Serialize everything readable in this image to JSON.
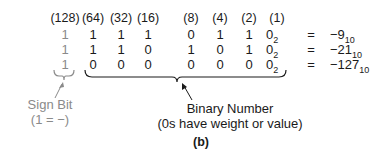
{
  "figure": {
    "weights": [
      "(128)",
      "(64)",
      "(32)",
      "(16)",
      "(8)",
      "(4)",
      "(2)",
      "(1)"
    ],
    "rows": [
      {
        "sign": "1",
        "bits": [
          "1",
          "1",
          "1",
          "0",
          "1",
          "1"
        ],
        "last": "0",
        "base": "2",
        "eq": "=",
        "value": "−9",
        "value_base": "10"
      },
      {
        "sign": "1",
        "bits": [
          "1",
          "1",
          "0",
          "1",
          "0",
          "1"
        ],
        "last": "0",
        "base": "2",
        "eq": "=",
        "value": "−21",
        "value_base": "10"
      },
      {
        "sign": "1",
        "bits": [
          "0",
          "0",
          "0",
          "0",
          "0",
          "0"
        ],
        "last": "0",
        "base": "2",
        "eq": "=",
        "value": "−127",
        "value_base": "10"
      }
    ],
    "sign_label": {
      "line1": "Sign Bit",
      "line2": "(1 = −)"
    },
    "binary_label": {
      "line1": "Binary Number",
      "line2": "(0s have weight or value)"
    },
    "caption": "(b)",
    "colors": {
      "text": "#1a1a1a",
      "sign": "#8a8a8a"
    }
  }
}
